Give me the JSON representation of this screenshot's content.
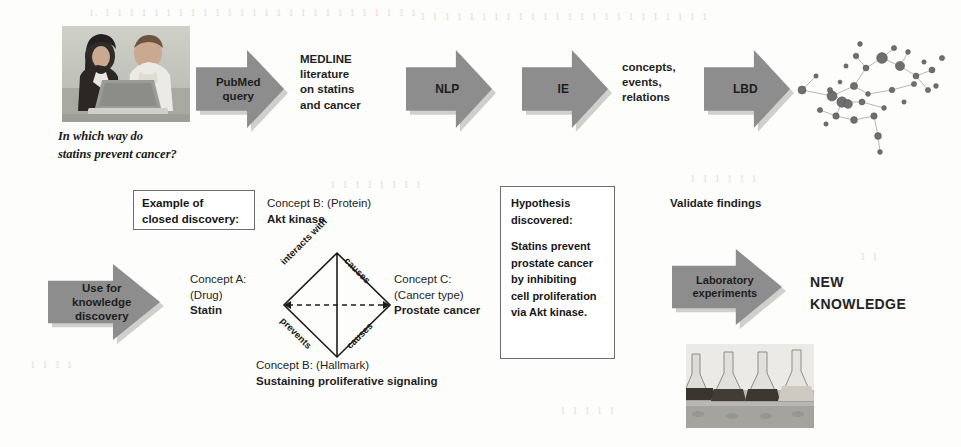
{
  "top_flow": {
    "photo_caption": {
      "line1": "In which way do",
      "line2": "statins prevent cancer?"
    },
    "arrows": [
      {
        "name": "pubmed-query",
        "lines": [
          "PubMed",
          "query"
        ]
      },
      {
        "name": "nlp",
        "lines": [
          "NLP"
        ]
      },
      {
        "name": "ie",
        "lines": [
          "IE"
        ]
      },
      {
        "name": "lbd",
        "lines": [
          "LBD"
        ]
      }
    ],
    "texts": [
      {
        "name": "medline-literature",
        "lines": [
          "MEDLINE",
          "literature",
          "on statins",
          "and cancer"
        ]
      },
      {
        "name": "concepts-events-relations",
        "lines": [
          "concepts,",
          "events,",
          "relations"
        ]
      }
    ],
    "graph_label": "concept-network-graph"
  },
  "bottom_flow": {
    "use_for_knowledge_discovery": {
      "lines": [
        "Use for",
        "knowledge",
        "discovery"
      ]
    },
    "example_box": {
      "line1": "Example of",
      "line2": "closed discovery:"
    },
    "concepts": {
      "concept_a": {
        "header": "Concept A:",
        "type": "(Drug)",
        "value": "Statin"
      },
      "concept_b_protein": {
        "header": "Concept B: (Protein)",
        "value": "Akt kinase"
      },
      "concept_b_hallmark": {
        "header": "Concept B: (Hallmark)",
        "value": "Sustaining proliferative signaling"
      },
      "concept_c": {
        "header": "Concept C:",
        "type": "(Cancer type)",
        "value": "Prostate cancer"
      }
    },
    "relations": {
      "top_left": "interacts with",
      "top_right": "causes",
      "bottom_left": "prevents",
      "bottom_right": "causes"
    },
    "hypothesis": {
      "heading_line1": "Hypothesis",
      "heading_line2": "discovered:",
      "body": [
        "Statins prevent",
        "prostate cancer",
        "by inhibiting",
        "cell proliferation",
        "via Akt kinase."
      ]
    },
    "validate_findings": "Validate findings",
    "laboratory_arrow": {
      "lines": [
        "Laboratory",
        "experiments"
      ]
    },
    "new_knowledge": {
      "line1": "NEW",
      "line2": "KNOWLEDGE"
    },
    "flasks_label": "laboratory-flasks-photo"
  },
  "colors": {
    "arrow_fill": "#8d8d8d",
    "arrow_shadow": "#cfcfcc",
    "text": "#1f1f1f",
    "box_border": "#6d6d6d",
    "background": "#fdfdfb",
    "node_fill": "#6f6f6f"
  },
  "ghost_text": [
    "L. 1 1 1",
    "v 1 I",
    "i r",
    "1",
    "r  I",
    "i",
    "J",
    "i 1"
  ]
}
